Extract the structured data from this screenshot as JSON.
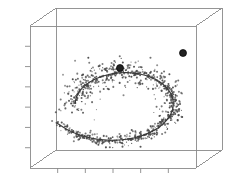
{
  "figure": {
    "name": "3d-spiral-scatter-plot",
    "background": "#ffffff",
    "width": 227,
    "height": 187
  },
  "chart_data": {
    "type": "scatter",
    "title": "",
    "subtitle": "",
    "xlabel": "",
    "ylabel": "",
    "zlabel": "",
    "projection": "3d",
    "grid": false,
    "legend": false,
    "legend_position": "none",
    "axis_ticks": {
      "left_axis_tick_count": 6,
      "bottom_axis_tick_count": 5,
      "tick_labels_shown": false
    },
    "xlim": [
      0,
      1
    ],
    "ylim": [
      0,
      1
    ],
    "zlim": [
      0,
      1
    ],
    "colors": {
      "points": "#4a4a4a",
      "curve": "#3a3a3a",
      "nodes": "#222222",
      "box": "#8a8a8a",
      "background": "#ffffff"
    },
    "series": [
      {
        "name": "noisy-spiral-points",
        "type": "scatter",
        "marker": "dot",
        "point_count": 640,
        "color": "#4a4a4a",
        "description": "noisy samples scattered about a 3D spiral manifold"
      },
      {
        "name": "principal-curve",
        "type": "line",
        "color": "#3a3a3a",
        "description": "fitted principal curve following the spiral"
      },
      {
        "name": "highlighted-nodes",
        "type": "scatter",
        "marker": "filled-circle",
        "color": "#222222",
        "values": [
          {
            "x": 183,
            "y": 53
          },
          {
            "x": 120,
            "y": 68
          }
        ],
        "description": "two emphasized node markers on the principal curve"
      }
    ],
    "box_geometry": {
      "front_left": 30,
      "front_right": 196,
      "front_top": 26,
      "front_bottom": 168,
      "depth_dx": 26,
      "depth_dy": -18
    }
  }
}
